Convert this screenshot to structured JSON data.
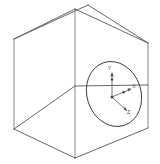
{
  "figure": {
    "background_color": "#ffffff",
    "line_color": "#565656",
    "circle_color": "#3a3a3a",
    "axis_color": "#5a5a5a",
    "label_color": "#4a4a4a"
  },
  "cube": {
    "name": "wireframe-cube",
    "vertices": {
      "front_top": [
        75,
        9
      ],
      "left_top": [
        14,
        39
      ],
      "right_top": [
        148,
        43
      ],
      "back_top": [
        88,
        5
      ],
      "front_bottom": [
        75,
        158
      ],
      "left_bottom": [
        14,
        129
      ],
      "right_bottom": [
        148,
        128
      ],
      "back_center": [
        75,
        86
      ]
    },
    "edges": [
      "front-top-to-left-top",
      "front-top-to-right-top",
      "left-top-to-back-top",
      "right-top-to-back-top",
      "left-vertical",
      "center-vertical",
      "right-vertical",
      "front-bottom-to-left-bottom",
      "front-bottom-to-right-bottom",
      "back-horizontal-left",
      "back-horizontal-right"
    ]
  },
  "circle": {
    "name": "inscribed-circle",
    "center": [
      114,
      94
    ],
    "radius_x": 27,
    "radius_y": 33,
    "rotation_deg": -18,
    "description": "circle inscribed on right face of cube shown in perspective as an ellipse"
  },
  "axes": {
    "origin": [
      112,
      97
    ],
    "items": [
      {
        "id": "y-axis",
        "label": "Y",
        "label_position": [
          110,
          69
        ],
        "tip": [
          112,
          73
        ],
        "direction": "up"
      },
      {
        "id": "x-axis",
        "label": "X",
        "label_position": [
          133,
          87
        ],
        "tip": [
          130,
          89
        ],
        "direction": "right"
      },
      {
        "id": "z-axis",
        "label": "Z",
        "label_position": [
          128,
          112
        ],
        "tip": [
          127,
          111
        ],
        "direction": "lower-right"
      }
    ]
  }
}
